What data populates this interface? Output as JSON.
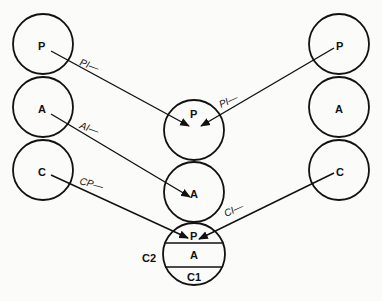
{
  "diagram": {
    "left_column": {
      "nodes": [
        "P",
        "A",
        "C"
      ]
    },
    "right_column": {
      "nodes": [
        "P",
        "A",
        "C"
      ]
    },
    "center_column": {
      "nodes": [
        "P",
        "A"
      ],
      "composite": {
        "sections": [
          "P",
          "A",
          "C1"
        ],
        "side_label": "C2"
      }
    },
    "edges": [
      {
        "from": "left.P",
        "to": "center.P",
        "label": "PI—"
      },
      {
        "from": "left.A",
        "to": "center.A",
        "label": "AI—"
      },
      {
        "from": "left.C",
        "to": "composite.P",
        "label": "CP—"
      },
      {
        "from": "right.P",
        "to": "center.P",
        "label": "PI—"
      },
      {
        "from": "right.C",
        "to": "composite.P",
        "label": "CI—"
      }
    ]
  }
}
